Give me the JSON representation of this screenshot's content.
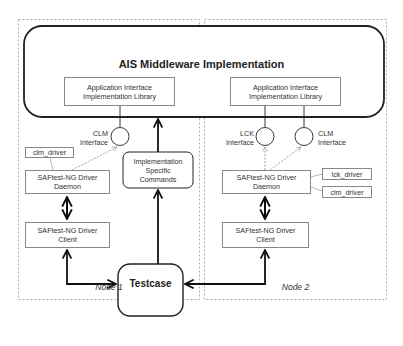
{
  "diagram": {
    "middleware": {
      "title": "AIS Middleware Implementation"
    },
    "node1": {
      "label": "Node 1",
      "library": "Application Interface Implementation Library",
      "library_lines": [
        "Application Interface",
        "Implementation Library"
      ],
      "interface": {
        "name": "CLM",
        "suffix": "Interface"
      },
      "driver_plugin": "clm_driver",
      "daemon_lines": [
        "SAFtest-NG Driver",
        "Daemon"
      ],
      "client_lines": [
        "SAFtest-NG Driver",
        "Client"
      ]
    },
    "node2": {
      "label": "Node 2",
      "library_lines": [
        "Application Interface",
        "Implementation Library"
      ],
      "interfaces": [
        {
          "name": "LCK",
          "suffix": "Interface"
        },
        {
          "name": "CLM",
          "suffix": "Interface"
        }
      ],
      "driver_plugins": [
        "lck_driver",
        "clm_driver"
      ],
      "daemon_lines": [
        "SAFtest-NG Driver",
        "Daemon"
      ],
      "client_lines": [
        "SAFtest-NG Driver",
        "Client"
      ]
    },
    "impl_specific_lines": [
      "Implementation",
      "Specific",
      "Commands"
    ],
    "testcase": "Testcase"
  }
}
